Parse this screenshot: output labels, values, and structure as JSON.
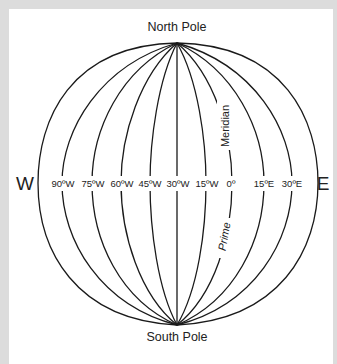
{
  "diagram": {
    "north_label": "North Pole",
    "south_label": "South Pole",
    "west_label": "W",
    "east_label": "E",
    "prime_meridian_label_top": "Meridian",
    "prime_meridian_label_bottom": "Prime",
    "meridian_labels": [
      "90ºW",
      "75ºW",
      "60ºW",
      "45ºW",
      "30ºW",
      "15ºW",
      "0º",
      "15ºE",
      "30ºE"
    ],
    "colors": {
      "line": "#1a1a1a",
      "frame": "#dcdcdc",
      "background": "#ffffff"
    }
  }
}
